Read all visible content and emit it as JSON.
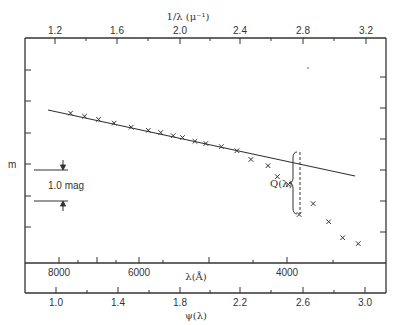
{
  "chart_data": {
    "type": "scatter",
    "title": "",
    "top_axis": {
      "label": "1/λ (μ⁻¹)",
      "ticks": [
        1.2,
        1.6,
        2.0,
        2.4,
        2.8,
        3.2
      ],
      "tick_labels": [
        "1.2",
        "1.6",
        "2.0",
        "2.4",
        "2.8",
        "3.2"
      ],
      "range": [
        1.0,
        3.3
      ]
    },
    "bottom_axis_lambda": {
      "label": "λ(Å)",
      "tick_labels": [
        "8000",
        "6000",
        "4000"
      ]
    },
    "bottom_axis_psi": {
      "label": "ψ(λ)",
      "ticks": [
        1.0,
        1.4,
        1.8,
        2.2,
        2.6,
        3.0
      ],
      "tick_labels": [
        "1.0",
        "1.4",
        "1.8",
        "2.2",
        "2.6",
        "3.0"
      ]
    },
    "ylabel": "m",
    "scale_bar_label": "1.0 mag",
    "annotation": "Q(λ)",
    "grid": false,
    "legend": null,
    "fit_line": {
      "x": [
        1.0,
        3.0
      ],
      "y_mag_relative": [
        0.0,
        2.1
      ]
    },
    "series": [
      {
        "name": "observed magnitudes",
        "marker": "x",
        "x_inverse_micron": [
          1.3,
          1.39,
          1.48,
          1.58,
          1.69,
          1.8,
          1.88,
          1.96,
          2.02,
          2.1,
          2.17,
          2.27,
          2.37,
          2.46,
          2.57,
          2.63,
          2.7,
          2.77,
          2.86,
          2.96,
          3.05,
          3.15
        ],
        "y_mag_relative": [
          0.1,
          0.2,
          0.3,
          0.42,
          0.55,
          0.65,
          0.72,
          0.82,
          0.88,
          1.0,
          1.07,
          1.17,
          1.3,
          1.58,
          1.78,
          2.13,
          2.38,
          3.34,
          2.99,
          3.57,
          4.08,
          4.27
        ]
      }
    ]
  }
}
